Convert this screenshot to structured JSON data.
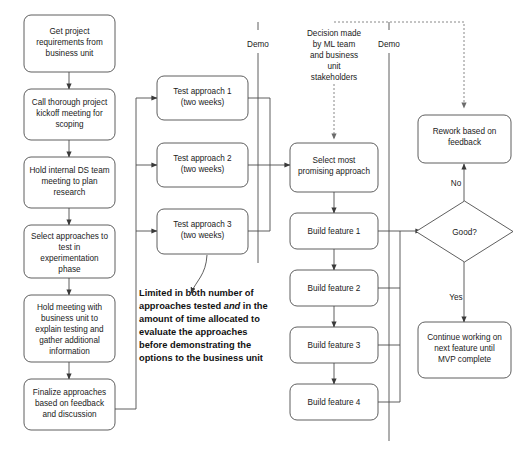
{
  "diagram": {
    "colors": {
      "background": "#ffffff",
      "node_stroke": "#4d4d4d",
      "node_fill": "#ffffff",
      "connector": "#4d4d4d",
      "dashed_connector": "#7a7a7a",
      "text": "#1a1a1a"
    },
    "left_column": [
      {
        "id": "get-requirements",
        "lines": [
          "Get project",
          "requirements from",
          "business unit"
        ]
      },
      {
        "id": "kickoff-meeting",
        "lines": [
          "Call thorough project",
          "kickoff meeting for",
          "scoping"
        ]
      },
      {
        "id": "internal-ds-meeting",
        "lines": [
          "Hold internal DS team",
          "meeting to plan",
          "research"
        ]
      },
      {
        "id": "select-approaches",
        "lines": [
          "Select approaches to",
          "test in",
          "experimentation",
          "phase"
        ]
      },
      {
        "id": "business-unit-meeting",
        "lines": [
          "Hold meeting with",
          "business unit to",
          "explain testing and",
          "gather additional",
          "information"
        ]
      },
      {
        "id": "finalize-approaches",
        "lines": [
          "Finalize approaches",
          "based on feedback",
          "and discussion"
        ]
      }
    ],
    "test_column": [
      {
        "id": "test-approach-1",
        "lines": [
          "Test approach 1",
          "(two weeks)"
        ]
      },
      {
        "id": "test-approach-2",
        "lines": [
          "Test approach 2",
          "(two weeks)"
        ]
      },
      {
        "id": "test-approach-3",
        "lines": [
          "Test approach 3",
          "(two weeks)"
        ]
      }
    ],
    "build_column": [
      {
        "id": "select-most-promising",
        "lines": [
          "Select most",
          "promising approach"
        ]
      },
      {
        "id": "build-feature-1",
        "lines": [
          "Build feature 1"
        ]
      },
      {
        "id": "build-feature-2",
        "lines": [
          "Build feature 2"
        ]
      },
      {
        "id": "build-feature-3",
        "lines": [
          "Build feature 3"
        ]
      },
      {
        "id": "build-feature-4",
        "lines": [
          "Build feature 4"
        ]
      }
    ],
    "right_column": [
      {
        "id": "rework-feedback",
        "lines": [
          "Rework based on",
          "feedback"
        ]
      },
      {
        "id": "good-decision",
        "lines": [
          "Good?"
        ]
      },
      {
        "id": "continue-working",
        "lines": [
          "Continue working on",
          "next feature until",
          "MVP complete"
        ]
      }
    ],
    "edge_labels": {
      "no": "No",
      "yes": "Yes"
    },
    "lifelines": [
      {
        "id": "demo-left",
        "label": "Demo"
      },
      {
        "id": "demo-right",
        "label": "Demo"
      }
    ],
    "decision_note": {
      "id": "decision-made-note",
      "lines": [
        {
          "text": "Decision made",
          "italic": false
        },
        {
          "text": "by ML team",
          "italic": false
        },
        {
          "text": "and business",
          "italic": true
        },
        {
          "text": "unit",
          "italic": true
        },
        {
          "text": "stakeholders",
          "italic": false
        }
      ]
    },
    "callout": {
      "id": "limited-scope-callout",
      "lines": [
        [
          {
            "text": "Limited in both number of",
            "italic": false
          }
        ],
        [
          {
            "text": "approaches tested ",
            "italic": false
          },
          {
            "text": "and",
            "italic": true
          },
          {
            "text": " in the",
            "italic": false
          }
        ],
        [
          {
            "text": "amount of time allocated to",
            "italic": false
          }
        ],
        [
          {
            "text": "evaluate the approaches",
            "italic": false
          }
        ],
        [
          {
            "text": "before demonstrating the",
            "italic": false
          }
        ],
        [
          {
            "text": "options to the business unit",
            "italic": false
          }
        ]
      ]
    }
  }
}
